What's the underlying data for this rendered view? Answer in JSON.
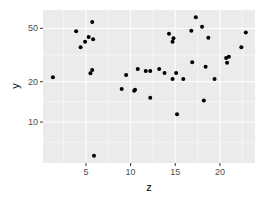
{
  "chart_data": {
    "type": "scatter",
    "title": "",
    "xlabel": "z",
    "ylabel": "y",
    "x_scale": "linear",
    "y_scale": "log10",
    "xlim": [
      0.4,
      24.0
    ],
    "ylim": [
      5.3,
      66
    ],
    "x_ticks": [
      5,
      10,
      15,
      20
    ],
    "x_tick_labels": [
      "5",
      "10",
      "15",
      "20"
    ],
    "y_ticks": [
      10,
      20,
      50
    ],
    "y_tick_labels": [
      "10",
      "20",
      "50"
    ],
    "grid": true,
    "legend": "none",
    "point_color": "#000000",
    "panel_background": "#ebebeb",
    "grid_color": "#ffffff",
    "points": [
      {
        "x": 1.3,
        "y": 21.6
      },
      {
        "x": 3.9,
        "y": 47.6
      },
      {
        "x": 4.4,
        "y": 36.1
      },
      {
        "x": 4.9,
        "y": 39.7
      },
      {
        "x": 5.3,
        "y": 43.0
      },
      {
        "x": 5.5,
        "y": 23.1
      },
      {
        "x": 5.7,
        "y": 55.7
      },
      {
        "x": 5.7,
        "y": 24.4
      },
      {
        "x": 5.8,
        "y": 41.4
      },
      {
        "x": 5.9,
        "y": 5.6
      },
      {
        "x": 9.0,
        "y": 17.6
      },
      {
        "x": 9.5,
        "y": 22.4
      },
      {
        "x": 10.4,
        "y": 17.1
      },
      {
        "x": 10.5,
        "y": 17.4
      },
      {
        "x": 10.8,
        "y": 24.9
      },
      {
        "x": 11.7,
        "y": 24.0
      },
      {
        "x": 12.2,
        "y": 24.0
      },
      {
        "x": 12.2,
        "y": 15.2
      },
      {
        "x": 13.2,
        "y": 24.9
      },
      {
        "x": 13.8,
        "y": 23.2
      },
      {
        "x": 14.3,
        "y": 45.6
      },
      {
        "x": 14.7,
        "y": 39.7
      },
      {
        "x": 14.7,
        "y": 20.9
      },
      {
        "x": 14.8,
        "y": 42.1
      },
      {
        "x": 15.1,
        "y": 23.2
      },
      {
        "x": 15.2,
        "y": 11.4
      },
      {
        "x": 15.9,
        "y": 20.9
      },
      {
        "x": 16.8,
        "y": 48.0
      },
      {
        "x": 16.9,
        "y": 27.9
      },
      {
        "x": 17.3,
        "y": 60.4
      },
      {
        "x": 18.0,
        "y": 51.3
      },
      {
        "x": 18.2,
        "y": 14.5
      },
      {
        "x": 18.4,
        "y": 25.8
      },
      {
        "x": 18.7,
        "y": 42.6
      },
      {
        "x": 19.4,
        "y": 20.9
      },
      {
        "x": 20.7,
        "y": 30.0
      },
      {
        "x": 20.8,
        "y": 27.7
      },
      {
        "x": 21.0,
        "y": 30.7
      },
      {
        "x": 22.4,
        "y": 36.1
      },
      {
        "x": 22.9,
        "y": 46.5
      }
    ]
  },
  "layout": {
    "panel": {
      "left": 43,
      "top": 10,
      "right": 255,
      "bottom": 163
    },
    "x_map": {
      "origin_px": 41.3,
      "px_per_unit": 8.93
    },
    "y_map": {
      "ref_value": 10,
      "ref_px": 122,
      "px_per_decade": 134
    }
  }
}
